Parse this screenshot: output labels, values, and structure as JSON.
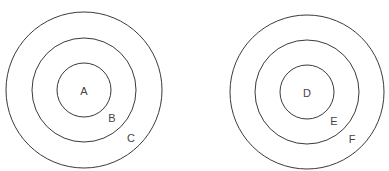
{
  "diagrams": [
    {
      "name": "left-concentric",
      "center": [
        84,
        90
      ],
      "radii": [
        27,
        52,
        78
      ],
      "labels": [
        {
          "text": "A",
          "x": 84,
          "y": 91
        },
        {
          "text": "B",
          "x": 112,
          "y": 118
        },
        {
          "text": "C",
          "x": 131,
          "y": 138
        }
      ]
    },
    {
      "name": "right-concentric",
      "center": [
        307,
        92
      ],
      "radii": [
        27,
        52,
        77
      ],
      "labels": [
        {
          "text": "D",
          "x": 307,
          "y": 93
        },
        {
          "text": "E",
          "x": 334,
          "y": 121
        },
        {
          "text": "F",
          "x": 352,
          "y": 139
        }
      ]
    }
  ],
  "stroke_color": "#3a3a3a",
  "label_color": "#444444"
}
